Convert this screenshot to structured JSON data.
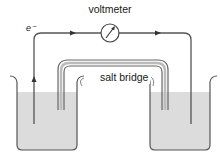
{
  "diagram": {
    "title": "voltmeter",
    "electron_label": "e⁻",
    "salt_bridge_label": "salt bridge",
    "components": [
      {
        "name": "voltmeter",
        "icon": "voltmeter-dial-icon"
      },
      {
        "name": "salt bridge"
      },
      {
        "name": "left beaker",
        "contents": "electrolyte solution"
      },
      {
        "name": "right beaker",
        "contents": "electrolyte solution"
      },
      {
        "name": "left electrode"
      },
      {
        "name": "right electrode"
      }
    ],
    "electron_flow": "left electrode -> voltmeter -> right electrode",
    "colors": {
      "line": "#555555",
      "liquid": "#dcdcdc",
      "text": "#1a1a1a"
    }
  }
}
